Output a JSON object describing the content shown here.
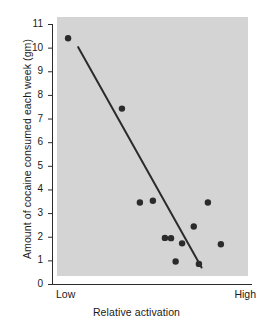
{
  "chart_data": {
    "type": "scatter",
    "title": "",
    "xlabel": "Relative activation",
    "ylabel": "Amount of cocaine consumed each week (gm)",
    "x_category_labels": [
      "Low",
      "High"
    ],
    "xlim": [
      0,
      1
    ],
    "ylim": [
      0,
      11
    ],
    "y_ticks": [
      0,
      1,
      2,
      3,
      4,
      5,
      6,
      7,
      8,
      9,
      10,
      11
    ],
    "y_tick_labels": [
      "0",
      "1",
      "2",
      "3",
      "4",
      "5",
      "6",
      "7",
      "8",
      "9",
      "10",
      "11"
    ],
    "grid": false,
    "legend": null,
    "plot_background_color": "#d4d4d4",
    "marker_color": "#2b2b2b",
    "line_color": "#2b2b2b",
    "points": [
      {
        "x": 0.058,
        "y": 10.4
      },
      {
        "x": 0.34,
        "y": 7.42
      },
      {
        "x": 0.434,
        "y": 3.45
      },
      {
        "x": 0.502,
        "y": 3.52
      },
      {
        "x": 0.565,
        "y": 1.95
      },
      {
        "x": 0.597,
        "y": 1.94
      },
      {
        "x": 0.655,
        "y": 1.72
      },
      {
        "x": 0.621,
        "y": 0.95
      },
      {
        "x": 0.716,
        "y": 2.43
      },
      {
        "x": 0.743,
        "y": 0.85
      },
      {
        "x": 0.79,
        "y": 3.45
      },
      {
        "x": 0.858,
        "y": 1.68
      }
    ],
    "regression_line": {
      "x_start": 0.111,
      "y_start": 10.02,
      "x_end": 0.757,
      "y_end": 0.7
    }
  }
}
